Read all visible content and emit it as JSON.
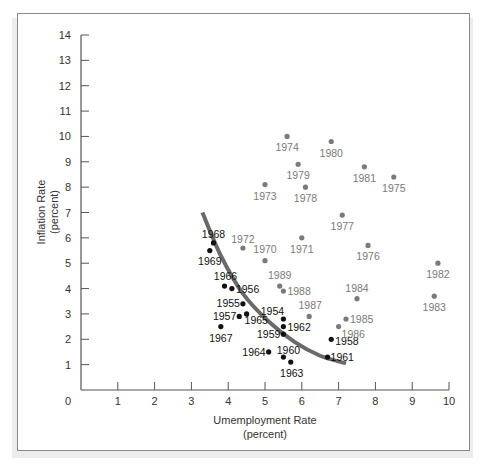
{
  "chart_data": {
    "type": "scatter",
    "title": "",
    "xlabel": "Umemployment Rate",
    "xlabel_sub": "(percent)",
    "ylabel": "Inflation Rate",
    "ylabel_sub": "(percent)",
    "xlim": [
      0,
      10
    ],
    "ylim": [
      0,
      14
    ],
    "x_ticks": [
      "0",
      "1",
      "2",
      "3",
      "4",
      "5",
      "6",
      "7",
      "8",
      "9",
      "10"
    ],
    "y_ticks": [
      "1",
      "2",
      "3",
      "4",
      "5",
      "6",
      "7",
      "8",
      "9",
      "10",
      "11",
      "12",
      "13",
      "14"
    ],
    "grid": false,
    "legend": null,
    "colors": {
      "early_series": "#111111",
      "late_series": "#7a7a7a",
      "curve": "#6a6a6a"
    },
    "series": [
      {
        "name": "1954-1969",
        "color": "#111111",
        "points": [
          {
            "label": "1954",
            "x": 5.5,
            "y": 2.8,
            "lx": -11,
            "ly": -4,
            "anchor": "middle"
          },
          {
            "label": "1955",
            "x": 4.4,
            "y": 3.4,
            "lx": -3,
            "ly": 3,
            "anchor": "end"
          },
          {
            "label": "1956",
            "x": 4.1,
            "y": 4.0,
            "lx": 4,
            "ly": 4,
            "anchor": "start"
          },
          {
            "label": "1957",
            "x": 4.3,
            "y": 2.9,
            "lx": -3,
            "ly": 4,
            "anchor": "end"
          },
          {
            "label": "1958",
            "x": 6.8,
            "y": 2.0,
            "lx": 4,
            "ly": 6,
            "anchor": "start"
          },
          {
            "label": "1959",
            "x": 5.5,
            "y": 2.2,
            "lx": -3,
            "ly": 4,
            "anchor": "end"
          },
          {
            "label": "1960",
            "x": 5.5,
            "y": 1.3,
            "lx": 5,
            "ly": -3,
            "anchor": "middle"
          },
          {
            "label": "1961",
            "x": 6.7,
            "y": 1.3,
            "lx": 3,
            "ly": 4,
            "anchor": "start"
          },
          {
            "label": "1962",
            "x": 5.5,
            "y": 2.5,
            "lx": 4,
            "ly": 4,
            "anchor": "start"
          },
          {
            "label": "1963",
            "x": 5.7,
            "y": 1.1,
            "lx": 1,
            "ly": 15,
            "anchor": "middle"
          },
          {
            "label": "1964",
            "x": 5.1,
            "y": 1.5,
            "lx": -3,
            "ly": 4,
            "anchor": "end"
          },
          {
            "label": "1965",
            "x": 4.5,
            "y": 3.0,
            "lx": -2,
            "ly": 10,
            "anchor": "start"
          },
          {
            "label": "1966",
            "x": 3.9,
            "y": 4.1,
            "lx": 1,
            "ly": -6,
            "anchor": "middle"
          },
          {
            "label": "1967",
            "x": 3.8,
            "y": 2.5,
            "lx": 0,
            "ly": 15,
            "anchor": "middle"
          },
          {
            "label": "1968",
            "x": 3.6,
            "y": 5.8,
            "lx": 0,
            "ly": -5,
            "anchor": "middle"
          },
          {
            "label": "1969",
            "x": 3.5,
            "y": 5.5,
            "lx": 0,
            "ly": 14,
            "anchor": "middle"
          }
        ]
      },
      {
        "name": "1970-1989",
        "color": "#7a7a7a",
        "points": [
          {
            "label": "1970",
            "x": 5.0,
            "y": 5.1,
            "lx": 0,
            "ly": -8,
            "anchor": "middle"
          },
          {
            "label": "1971",
            "x": 6.0,
            "y": 6.0,
            "lx": 0,
            "ly": 15,
            "anchor": "middle"
          },
          {
            "label": "1972",
            "x": 4.4,
            "y": 5.6,
            "lx": 0,
            "ly": -5,
            "anchor": "middle"
          },
          {
            "label": "1973",
            "x": 5.0,
            "y": 8.1,
            "lx": 0,
            "ly": 15,
            "anchor": "middle"
          },
          {
            "label": "1974",
            "x": 5.6,
            "y": 10.0,
            "lx": 0,
            "ly": 15,
            "anchor": "middle"
          },
          {
            "label": "1975",
            "x": 8.5,
            "y": 8.4,
            "lx": 0,
            "ly": 15,
            "anchor": "middle"
          },
          {
            "label": "1976",
            "x": 7.8,
            "y": 5.7,
            "lx": 0,
            "ly": 15,
            "anchor": "middle"
          },
          {
            "label": "1977",
            "x": 7.1,
            "y": 6.9,
            "lx": 0,
            "ly": 15,
            "anchor": "middle"
          },
          {
            "label": "1978",
            "x": 6.1,
            "y": 8.0,
            "lx": 0,
            "ly": 15,
            "anchor": "middle"
          },
          {
            "label": "1979",
            "x": 5.9,
            "y": 8.9,
            "lx": 0,
            "ly": 15,
            "anchor": "middle"
          },
          {
            "label": "1980",
            "x": 6.8,
            "y": 9.8,
            "lx": 0,
            "ly": 15,
            "anchor": "middle"
          },
          {
            "label": "1981",
            "x": 7.7,
            "y": 8.8,
            "lx": 0,
            "ly": 15,
            "anchor": "middle"
          },
          {
            "label": "1982",
            "x": 9.7,
            "y": 5.0,
            "lx": 0,
            "ly": 15,
            "anchor": "middle"
          },
          {
            "label": "1983",
            "x": 9.6,
            "y": 3.7,
            "lx": 0,
            "ly": 15,
            "anchor": "middle"
          },
          {
            "label": "1984",
            "x": 7.5,
            "y": 3.6,
            "lx": 0,
            "ly": -7,
            "anchor": "middle"
          },
          {
            "label": "1985",
            "x": 7.2,
            "y": 2.8,
            "lx": 4,
            "ly": 4,
            "anchor": "start"
          },
          {
            "label": "1986",
            "x": 7.0,
            "y": 2.5,
            "lx": 3,
            "ly": 11,
            "anchor": "start"
          },
          {
            "label": "1987",
            "x": 6.2,
            "y": 2.9,
            "lx": 1,
            "ly": -7,
            "anchor": "middle"
          },
          {
            "label": "1988",
            "x": 5.5,
            "y": 3.9,
            "lx": 4,
            "ly": 4,
            "anchor": "start"
          },
          {
            "label": "1989",
            "x": 5.4,
            "y": 4.1,
            "lx": 0,
            "ly": -7,
            "anchor": "middle"
          }
        ]
      }
    ],
    "curve": {
      "name": "Phillips curve",
      "points": [
        [
          3.3,
          7.0
        ],
        [
          3.8,
          5.3
        ],
        [
          4.4,
          3.8
        ],
        [
          5.1,
          2.7
        ],
        [
          5.8,
          1.9
        ],
        [
          6.5,
          1.35
        ],
        [
          7.2,
          1.05
        ]
      ]
    }
  }
}
